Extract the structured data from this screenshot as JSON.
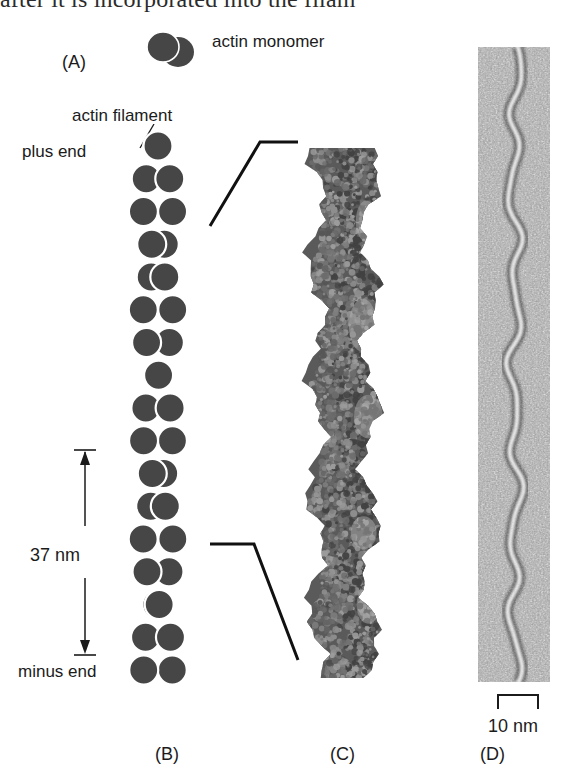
{
  "figure": {
    "clipped_header_text": "after it is incorporated into the filam",
    "background_color": "#ffffff",
    "monomer_color": "#464646",
    "outline_color": "#ffffff",
    "ink_color": "#1b1b1b"
  },
  "panel_a": {
    "caption": "(A)",
    "monomer_label": "actin monomer",
    "monomer_icon": "two-lobed-monomer-icon"
  },
  "panel_b": {
    "caption": "(B)",
    "filament_label": "actin filament",
    "plus_end_label": "plus end",
    "minus_end_label": "minus end",
    "scale_label": "37 nm",
    "scale_icon": "double-headed-vertical-arrow-icon",
    "subunits_per_strand": 17,
    "helix_repeat_nm": 37
  },
  "panel_c": {
    "caption": "(C)",
    "model_icon": "space-filling-molecular-model-icon"
  },
  "panel_d": {
    "caption": "(D)",
    "scale_label": "10 nm",
    "scale_icon": "bracket-scale-bar-icon",
    "image_icon": "electron-micrograph-icon"
  },
  "chart_data": {
    "type": "diagram",
    "panels": [
      {
        "id": "A",
        "label": "(A)",
        "content": "actin monomer"
      },
      {
        "id": "B",
        "label": "(B)",
        "content": "actin filament schematic",
        "annotations": [
          "plus end",
          "actin filament",
          "37 nm",
          "minus end"
        ]
      },
      {
        "id": "C",
        "label": "(C)",
        "content": "space-filling atomic model"
      },
      {
        "id": "D",
        "label": "(D)",
        "content": "electron micrograph",
        "annotations": [
          "10 nm"
        ]
      }
    ],
    "measurements": [
      {
        "label": "37 nm",
        "value": 37,
        "unit": "nm",
        "panel": "B",
        "meaning": "helical repeat"
      },
      {
        "label": "10 nm",
        "value": 10,
        "unit": "nm",
        "panel": "D",
        "meaning": "scale bar"
      }
    ]
  }
}
